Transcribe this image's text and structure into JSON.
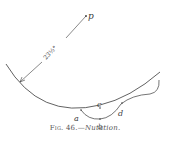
{
  "figure": {
    "pole_label": "p",
    "angle_label": "23½°",
    "point_labels": {
      "a": "a",
      "b": "b",
      "c": "c",
      "d": "d"
    },
    "caption": {
      "number": "Fig. 46.",
      "separator": "—",
      "title": "Nutation."
    },
    "colors": {
      "ink": "#3a3a3a",
      "background": "#ffffff"
    }
  }
}
